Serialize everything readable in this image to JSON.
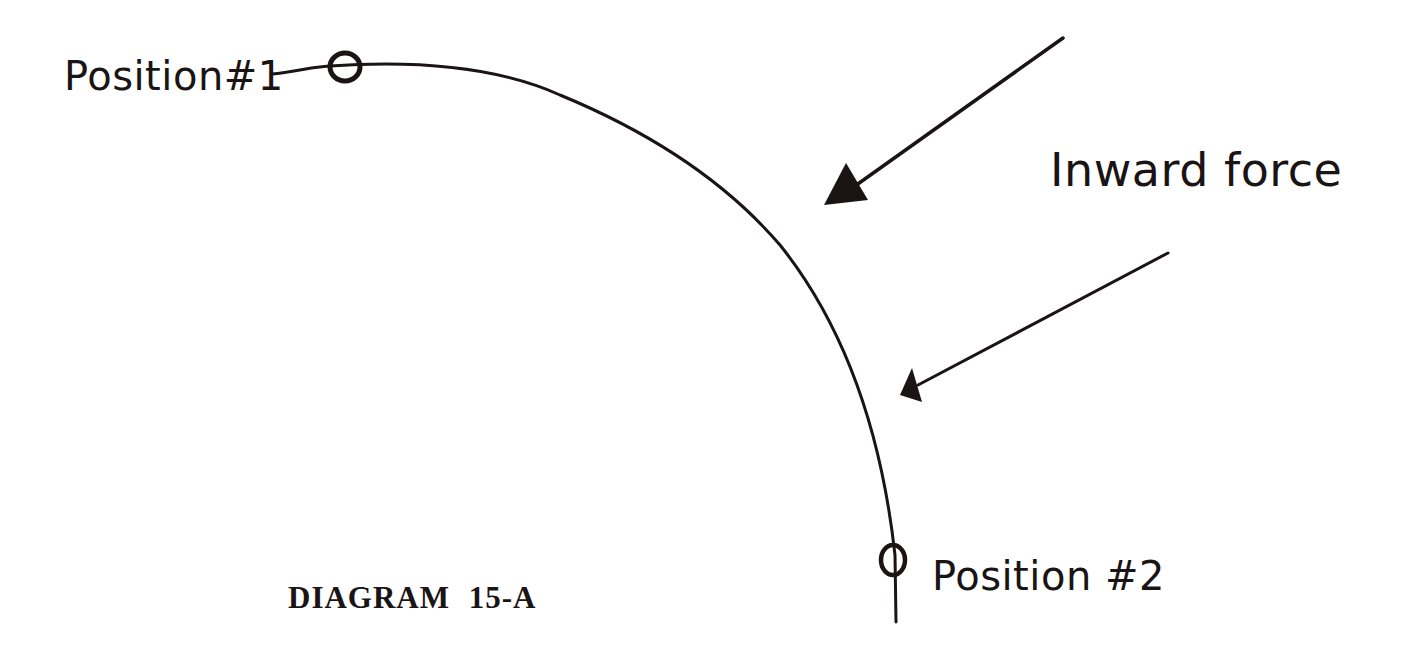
{
  "diagram": {
    "title": "DIAGRAM 15-A",
    "labels": {
      "position1": "Position#1",
      "position2": "Position #2",
      "force": "Inward force"
    },
    "colors": {
      "ink": "#1a1414",
      "background": "#ffffff"
    },
    "elements": {
      "path": "curved circular-arc path from Position #1 (top) to Position #2 (bottom right)",
      "markers": [
        "position-1-marker",
        "position-2-marker"
      ],
      "arrows": [
        "upper-inward-force-arrow",
        "lower-inward-force-arrow"
      ]
    }
  }
}
